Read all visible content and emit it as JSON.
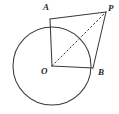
{
  "figure": {
    "background_color": "#ffffff",
    "stroke_color": "#3a3a3a",
    "label_color": "#2b2b2b"
  },
  "labels": {
    "A": "A",
    "P": "P",
    "B": "B",
    "O": "O"
  },
  "geometry": {
    "circle": {
      "name": "main-circle",
      "cx": 52,
      "cy": 66,
      "r": 39
    },
    "points": [
      {
        "name": "point-O",
        "label": "O",
        "x": 52,
        "y": 66
      },
      {
        "name": "point-A",
        "label": "A",
        "x": 50,
        "y": 19
      },
      {
        "name": "point-B",
        "label": "B",
        "x": 93,
        "y": 68
      },
      {
        "name": "point-P",
        "label": "P",
        "x": 106,
        "y": 12
      }
    ],
    "segments": [
      {
        "name": "segment-OA",
        "from": "O",
        "to": "A",
        "x1": 52,
        "y1": 66,
        "x2": 50,
        "y2": 19,
        "style": "solid"
      },
      {
        "name": "segment-AP",
        "from": "A",
        "to": "P",
        "x1": 50,
        "y1": 19,
        "x2": 106,
        "y2": 12,
        "style": "solid"
      },
      {
        "name": "segment-PB",
        "from": "P",
        "to": "B",
        "x1": 106,
        "y1": 12,
        "x2": 93,
        "y2": 68,
        "style": "solid"
      },
      {
        "name": "segment-BO",
        "from": "B",
        "to": "O",
        "x1": 93,
        "y1": 68,
        "x2": 52,
        "y2": 66,
        "style": "solid"
      },
      {
        "name": "segment-OP",
        "from": "O",
        "to": "P",
        "x1": 52,
        "y1": 66,
        "x2": 106,
        "y2": 12,
        "style": "dashed"
      }
    ]
  }
}
